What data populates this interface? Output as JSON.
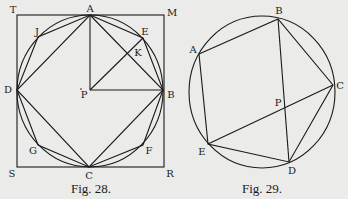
{
  "figures": [
    {
      "caption": "Fig. 28.",
      "labels": {
        "T": "T",
        "A": "A",
        "M": "M",
        "J": "J",
        "E": "E",
        "K": "K",
        "D": "D",
        "P": "P",
        "B": "B",
        "G": "G",
        "F": "F",
        "S": "S",
        "C": "C",
        "R": "R"
      },
      "description": "Square TMRS circumscribing a circle with center P; inscribed square ABCD and regular octagon AEBFCGDJ; radii PA, PB, PE with PE crossing AB at K"
    },
    {
      "caption": "Fig. 29.",
      "labels": {
        "A": "A",
        "B": "B",
        "C": "C",
        "P": "P",
        "E": "E",
        "D": "D"
      },
      "description": "Circle with inscribed pentagon ABCDE; diagonals BD and CE intersecting at P"
    }
  ],
  "colors": {
    "background": "#ebebea",
    "ink": "#1a1a1a"
  }
}
